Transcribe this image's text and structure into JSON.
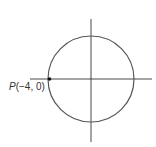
{
  "figure": {
    "colors": {
      "axis": "#333333",
      "circle": "#555555",
      "point": "#111111",
      "text": "#333333"
    },
    "axes": {
      "origin_px": [
        91,
        79
      ],
      "x_axis_px": {
        "x1": 30,
        "x2": 152,
        "y": 79
      },
      "y_axis_px": {
        "x": 91,
        "y1": 19,
        "y2": 142
      }
    },
    "circle": {
      "center_px": [
        91,
        79
      ],
      "radius_px": 43,
      "center": [
        0,
        0
      ],
      "radius": 4
    },
    "point": {
      "name": "P",
      "coords_label": "(−4, 0)",
      "x": -4,
      "y": 0,
      "px": [
        49,
        79
      ]
    }
  }
}
